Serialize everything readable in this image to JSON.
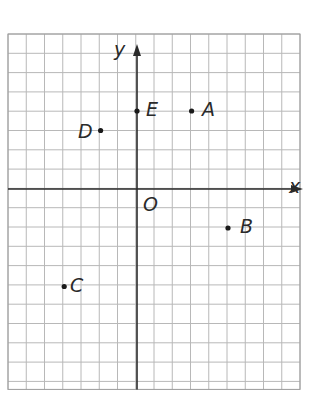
{
  "diagram": {
    "type": "coordinate-plane",
    "grid": {
      "left_px": 8,
      "top_px": 34,
      "cols": 16,
      "rows": 18,
      "cell_w_px": 18.25,
      "cell_h_px": 19.3,
      "line_color": "#b8b8b8",
      "border_color": "#9a9a9a"
    },
    "origin_px": {
      "x": 137,
      "y": 189
    },
    "axes": {
      "color": "#2a2a2a",
      "x_label": "x",
      "y_label": "y",
      "origin_label": "O"
    },
    "points": [
      {
        "name": "A",
        "x": 3,
        "y": 4
      },
      {
        "name": "B",
        "x": 5,
        "y": -2
      },
      {
        "name": "C",
        "x": -4,
        "y": -5
      },
      {
        "name": "D",
        "x": -2,
        "y": 3
      },
      {
        "name": "E",
        "x": 0,
        "y": 4
      }
    ]
  },
  "labels": {
    "x_axis": "x",
    "y_axis": "y",
    "origin": "O",
    "A": "A",
    "B": "B",
    "C": "C",
    "D": "D",
    "E": "E"
  }
}
